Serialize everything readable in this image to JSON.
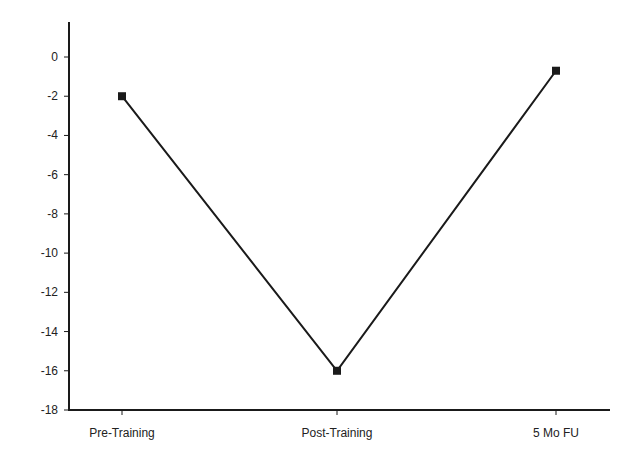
{
  "chart_data": {
    "type": "line",
    "title": "",
    "xlabel": "",
    "ylabel": "",
    "categories": [
      "Pre-Training",
      "Post-Training",
      "5 Mo FU"
    ],
    "series": [
      {
        "name": "Series 1",
        "values": [
          -2.0,
          -16.0,
          -0.7
        ],
        "marker": "square",
        "color": "#1a1a1a"
      }
    ],
    "ylim": [
      -18,
      2
    ],
    "yticks": [
      0,
      -2,
      -4,
      -6,
      -8,
      -10,
      -12,
      -14,
      -16,
      -18
    ],
    "ytick_labels": [
      "0",
      "-2",
      "-4",
      "-6",
      "-8",
      "-10",
      "-12",
      "-14",
      "-16",
      "-18"
    ],
    "grid": false,
    "legend": false
  }
}
